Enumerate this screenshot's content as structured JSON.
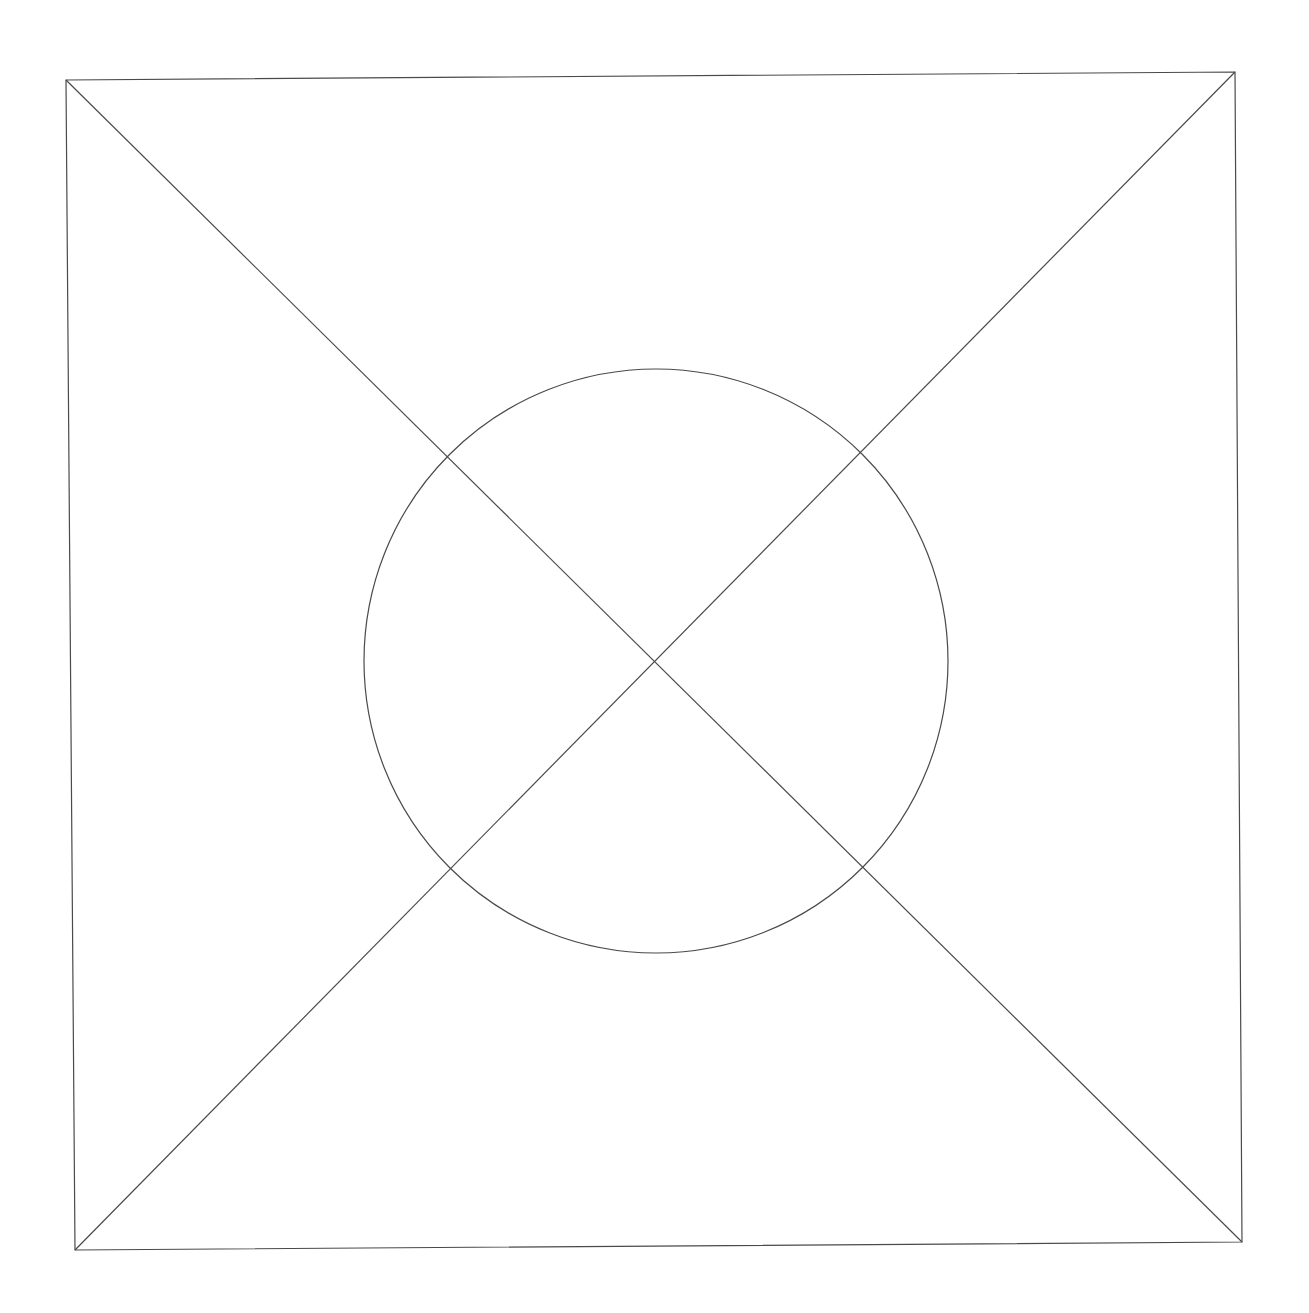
{
  "diagram": {
    "background": "#ffffff",
    "stroke_color": "#4a4a4a",
    "stroke_width": 1.2,
    "frame": {
      "top_left": [
        66,
        80
      ],
      "top_right": [
        1235,
        72
      ],
      "bottom_right": [
        1242,
        1242
      ],
      "bottom_left": [
        75,
        1250
      ]
    },
    "diagonals": [
      {
        "from": [
          66,
          80
        ],
        "to": [
          1242,
          1242
        ]
      },
      {
        "from": [
          1235,
          72
        ],
        "to": [
          75,
          1250
        ]
      }
    ],
    "circle": {
      "cx": 656,
      "cy": 661,
      "r": 292
    }
  }
}
